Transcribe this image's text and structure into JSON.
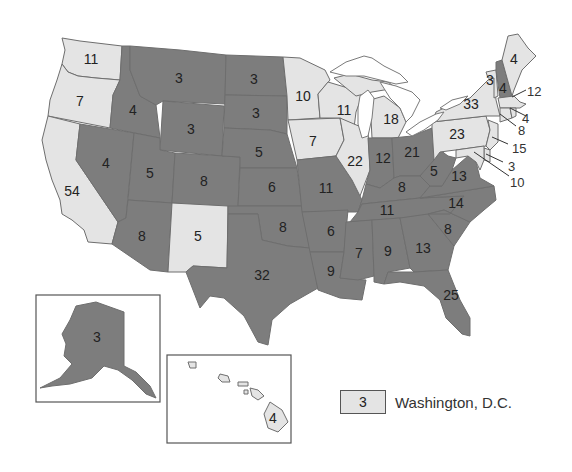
{
  "colors": {
    "dark_party": "#7d7d7d",
    "light_party": "#e4e4e4",
    "border": "#6e6e6e",
    "background": "#ffffff"
  },
  "states": [
    {
      "abbr": "WA",
      "votes": "11",
      "shade": "light"
    },
    {
      "abbr": "OR",
      "votes": "7",
      "shade": "light"
    },
    {
      "abbr": "CA",
      "votes": "54",
      "shade": "light"
    },
    {
      "abbr": "ID",
      "votes": "4",
      "shade": "dark"
    },
    {
      "abbr": "NV",
      "votes": "4",
      "shade": "dark"
    },
    {
      "abbr": "MT",
      "votes": "3",
      "shade": "dark"
    },
    {
      "abbr": "WY",
      "votes": "3",
      "shade": "dark"
    },
    {
      "abbr": "UT",
      "votes": "5",
      "shade": "dark"
    },
    {
      "abbr": "AZ",
      "votes": "8",
      "shade": "dark"
    },
    {
      "abbr": "CO",
      "votes": "8",
      "shade": "dark"
    },
    {
      "abbr": "NM",
      "votes": "5",
      "shade": "light"
    },
    {
      "abbr": "ND",
      "votes": "3",
      "shade": "dark"
    },
    {
      "abbr": "SD",
      "votes": "3",
      "shade": "dark"
    },
    {
      "abbr": "NE",
      "votes": "5",
      "shade": "dark"
    },
    {
      "abbr": "KS",
      "votes": "6",
      "shade": "dark"
    },
    {
      "abbr": "OK",
      "votes": "8",
      "shade": "dark"
    },
    {
      "abbr": "TX",
      "votes": "32",
      "shade": "dark"
    },
    {
      "abbr": "MN",
      "votes": "10",
      "shade": "light"
    },
    {
      "abbr": "IA",
      "votes": "7",
      "shade": "light"
    },
    {
      "abbr": "MO",
      "votes": "11",
      "shade": "dark"
    },
    {
      "abbr": "AR",
      "votes": "6",
      "shade": "dark"
    },
    {
      "abbr": "LA",
      "votes": "9",
      "shade": "dark"
    },
    {
      "abbr": "WI",
      "votes": "11",
      "shade": "light"
    },
    {
      "abbr": "IL",
      "votes": "22",
      "shade": "light"
    },
    {
      "abbr": "MI",
      "votes": "18",
      "shade": "light"
    },
    {
      "abbr": "IN",
      "votes": "12",
      "shade": "dark"
    },
    {
      "abbr": "OH",
      "votes": "21",
      "shade": "dark"
    },
    {
      "abbr": "KY",
      "votes": "8",
      "shade": "dark"
    },
    {
      "abbr": "TN",
      "votes": "11",
      "shade": "dark"
    },
    {
      "abbr": "MS",
      "votes": "7",
      "shade": "dark"
    },
    {
      "abbr": "AL",
      "votes": "9",
      "shade": "dark"
    },
    {
      "abbr": "GA",
      "votes": "13",
      "shade": "dark"
    },
    {
      "abbr": "FL",
      "votes": "25",
      "shade": "dark"
    },
    {
      "abbr": "SC",
      "votes": "8",
      "shade": "dark"
    },
    {
      "abbr": "NC",
      "votes": "14",
      "shade": "dark"
    },
    {
      "abbr": "VA",
      "votes": "13",
      "shade": "dark"
    },
    {
      "abbr": "WV",
      "votes": "5",
      "shade": "dark"
    },
    {
      "abbr": "PA",
      "votes": "23",
      "shade": "light"
    },
    {
      "abbr": "NY",
      "votes": "33",
      "shade": "light"
    },
    {
      "abbr": "VT",
      "votes": "3",
      "shade": "light"
    },
    {
      "abbr": "NH",
      "votes": "4",
      "shade": "dark"
    },
    {
      "abbr": "ME",
      "votes": "4",
      "shade": "light"
    },
    {
      "abbr": "MA",
      "votes": "12",
      "shade": "light"
    },
    {
      "abbr": "RI",
      "votes": "4",
      "shade": "light"
    },
    {
      "abbr": "CT",
      "votes": "8",
      "shade": "light"
    },
    {
      "abbr": "NJ",
      "votes": "15",
      "shade": "light"
    },
    {
      "abbr": "DE",
      "votes": "3",
      "shade": "light"
    },
    {
      "abbr": "MD",
      "votes": "10",
      "shade": "light"
    },
    {
      "abbr": "AK",
      "votes": "3",
      "shade": "dark"
    },
    {
      "abbr": "HI",
      "votes": "4",
      "shade": "light"
    }
  ],
  "legend": {
    "swatch_value": "3",
    "label": "Washington, D.C.",
    "shade": "light"
  }
}
